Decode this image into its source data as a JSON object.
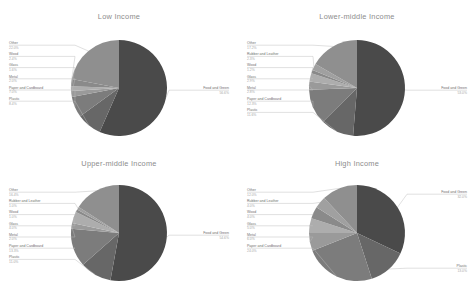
{
  "figure": {
    "background": "#ffffff",
    "title_color": "#8c8c8c",
    "label_color": "#6f6f6f",
    "pct_color": "#a8a8a8",
    "leader_color": "#b9b9b9"
  },
  "palette": {
    "food_and_green": "#4a4a4a",
    "plastic": "#676767",
    "paper_and_cardboard": "#7c7c7c",
    "metal": "#9a9a9a",
    "glass": "#adadad",
    "wood": "#8a8a8a",
    "rubber_and_leather": "#a0a0a0",
    "other": "#8f8f8f"
  },
  "chart_data": [
    {
      "type": "pie",
      "title": "Low Income",
      "labels": [
        "Food and Green",
        "Plastic",
        "Paper and Cardboard",
        "Metal",
        "Glass",
        "Wood",
        "Other"
      ],
      "values": [
        56.6,
        8.4,
        7.0,
        2.0,
        1.6,
        2.4,
        22.0
      ],
      "value_labels": [
        "56.6%",
        "8.4%",
        "7.0%",
        "2.0%",
        "1.6%",
        "2.4%",
        "22.0%"
      ],
      "colors": [
        "#4a4a4a",
        "#676767",
        "#7c7c7c",
        "#9a9a9a",
        "#adadad",
        "#8a8a8a",
        "#8f8f8f"
      ],
      "start_angle": 90,
      "direction": "clockwise",
      "legend": "none",
      "grid": false
    },
    {
      "type": "pie",
      "title": "Lower-middle Income",
      "labels": [
        "Food and Green",
        "Plastic",
        "Paper and Cardboard",
        "Metal",
        "Glass",
        "Wood",
        "Rubber and Leather",
        "Other"
      ],
      "values": [
        53.0,
        11.6,
        12.3,
        2.8,
        2.9,
        1.2,
        2.3,
        17.2
      ],
      "value_labels": [
        "53.0%",
        "11.6%",
        "12.3%",
        "2.8%",
        "2.9%",
        "1.2%",
        "2.3%",
        "17.2%"
      ],
      "colors": [
        "#4a4a4a",
        "#676767",
        "#7c7c7c",
        "#9a9a9a",
        "#adadad",
        "#8a8a8a",
        "#a0a0a0",
        "#8f8f8f"
      ],
      "start_angle": 90,
      "direction": "clockwise",
      "legend": "none",
      "grid": false
    },
    {
      "type": "pie",
      "title": "Upper-middle Income",
      "labels": [
        "Food and Green",
        "Plastic",
        "Paper and Cardboard",
        "Metal",
        "Glass",
        "Wood",
        "Rubber and Leather",
        "Other"
      ],
      "values": [
        54.6,
        11.0,
        13.3,
        2.0,
        4.0,
        1.0,
        1.0,
        16.4
      ],
      "value_labels": [
        "54.6%",
        "11.0%",
        "13.3%",
        "2.0%",
        "4.0%",
        "1.0%",
        "1.0%",
        "16.4%"
      ],
      "colors": [
        "#4a4a4a",
        "#676767",
        "#7c7c7c",
        "#9a9a9a",
        "#adadad",
        "#8a8a8a",
        "#a0a0a0",
        "#8f8f8f"
      ],
      "start_angle": 90,
      "direction": "clockwise",
      "legend": "none",
      "grid": false
    },
    {
      "type": "pie",
      "title": "High Income",
      "labels": [
        "Food and Green",
        "Plastic",
        "Paper and Cardboard",
        "Metal",
        "Glass",
        "Wood",
        "Rubber and Leather",
        "Other"
      ],
      "values": [
        32.0,
        13.0,
        24.0,
        6.0,
        5.0,
        4.0,
        4.0,
        12.0
      ],
      "value_labels": [
        "32.0%",
        "13.0%",
        "24.0%",
        "6.0%",
        "5.0%",
        "4.0%",
        "4.0%",
        "12.0%"
      ],
      "colors": [
        "#4a4a4a",
        "#676767",
        "#7c7c7c",
        "#9a9a9a",
        "#adadad",
        "#8a8a8a",
        "#a0a0a0",
        "#8f8f8f"
      ],
      "start_angle": 90,
      "direction": "clockwise",
      "legend": "none",
      "grid": false
    }
  ]
}
